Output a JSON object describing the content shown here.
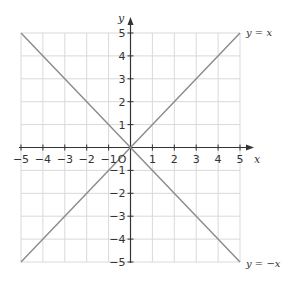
{
  "chart_data": {
    "type": "line",
    "title": "",
    "xlabel": "x",
    "ylabel": "y",
    "xlim": [
      -5,
      5
    ],
    "ylim": [
      -5,
      5
    ],
    "grid": true,
    "x_ticks": [
      -5,
      -4,
      -3,
      -2,
      -1,
      1,
      2,
      3,
      4,
      5
    ],
    "y_ticks": [
      5,
      4,
      3,
      2,
      1,
      -1,
      -2,
      -3,
      -4,
      -5
    ],
    "origin_label": "O",
    "series": [
      {
        "name": "y = x",
        "x": [
          -5,
          5
        ],
        "y": [
          -5,
          5
        ],
        "color": "#8a8a8a"
      },
      {
        "name": "y = −x",
        "x": [
          -5,
          5
        ],
        "y": [
          5,
          -5
        ],
        "color": "#8a8a8a"
      }
    ],
    "annotations": [
      {
        "text": "y = x",
        "at": [
          5,
          5
        ],
        "position": "right"
      },
      {
        "text": "y = −x",
        "at": [
          5,
          -5
        ],
        "position": "right"
      }
    ]
  },
  "labels": {
    "x_axis": "x",
    "y_axis": "y",
    "origin": "O",
    "line1": "y = x",
    "line2": "y = −x",
    "x_ticks": [
      "−5",
      "−4",
      "−3",
      "−2",
      "−1",
      "1",
      "2",
      "3",
      "4",
      "5"
    ],
    "y_ticks": [
      "5",
      "4",
      "3",
      "2",
      "1",
      "−1",
      "−2",
      "−3",
      "−4",
      "−5"
    ]
  },
  "colors": {
    "grid": "#d9d9d9",
    "axis": "#333333",
    "lines": "#8a8a8a"
  }
}
